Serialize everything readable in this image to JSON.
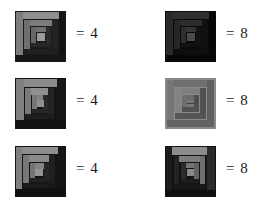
{
  "page": {
    "background": "#ffffff"
  },
  "blocks": [
    {
      "id": "block-row1-left",
      "row": 1,
      "column": "left",
      "pattern": "log-cabin",
      "equation_label": "= 4",
      "value": "4",
      "palette": {
        "border": "#6a6a6a",
        "ring1": "#8f8f8f",
        "ring2": "#3a3a3a",
        "ring3": "#7d7d7d",
        "ring4": "#262626",
        "ring5": "#6e6e6e",
        "center": "#9a9a9a",
        "dark": "#1a1a1a"
      }
    },
    {
      "id": "block-row1-right",
      "row": 1,
      "column": "right",
      "pattern": "log-cabin",
      "equation_label": "= 8",
      "value": "8",
      "palette": {
        "border": "#3d3d3d",
        "ring1": "#2a2a2a",
        "ring2": "#141414",
        "ring3": "#333333",
        "ring4": "#0d0d0d",
        "ring5": "#3a3a3a",
        "center": "#4a4a4a",
        "dark": "#080808"
      }
    },
    {
      "id": "block-row2-left",
      "row": 2,
      "column": "left",
      "pattern": "log-cabin",
      "equation_label": "= 4",
      "value": "4",
      "palette": {
        "border": "#707070",
        "ring1": "#8b8b8b",
        "ring2": "#313131",
        "ring3": "#818181",
        "ring4": "#1f1f1f",
        "ring5": "#6b6b6b",
        "center": "#909090",
        "dark": "#121212"
      }
    },
    {
      "id": "block-row2-right",
      "row": 2,
      "column": "right",
      "pattern": "log-cabin",
      "equation_label": "= 8",
      "value": "8",
      "palette": {
        "border": "#8a8a8a",
        "ring1": "#6f6f6f",
        "ring2": "#5a5a5a",
        "ring3": "#7b7b7b",
        "ring4": "#4e4e4e",
        "ring5": "#868686",
        "center": "#6c6c6c",
        "dark": "#474747"
      }
    },
    {
      "id": "block-row3-left",
      "row": 3,
      "column": "left",
      "pattern": "log-cabin",
      "equation_label": "= 4",
      "value": "4",
      "palette": {
        "border": "#6d6d6d",
        "ring1": "#8d8d8d",
        "ring2": "#2e2e2e",
        "ring3": "#7f7f7f",
        "ring4": "#1c1c1c",
        "ring5": "#5e5e5e",
        "center": "#949494",
        "dark": "#101010"
      }
    },
    {
      "id": "block-row3-right",
      "row": 3,
      "column": "right",
      "pattern": "log-cabin",
      "equation_label": "= 8",
      "value": "8",
      "palette": {
        "border": "#797979",
        "ring1": "#8c8c8c",
        "ring2": "#2b2b2b",
        "ring3": "#747474",
        "ring4": "#1d1d1d",
        "ring5": "#636363",
        "center": "#8a8a8a",
        "dark": "#0f0f0f"
      }
    }
  ]
}
